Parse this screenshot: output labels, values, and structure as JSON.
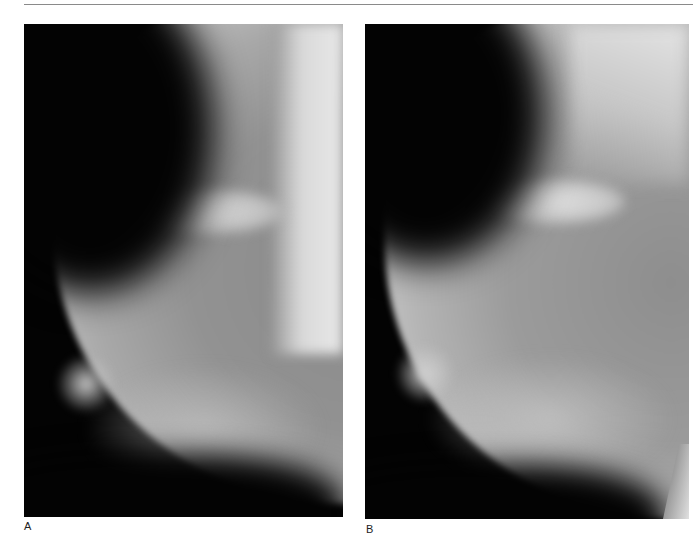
{
  "header": {
    "running_head_fragment": "graphy"
  },
  "figure": {
    "panels": [
      {
        "label": "A",
        "content": "mediolateral oblique mammogram"
      },
      {
        "label": "B",
        "content": "mediolateral oblique mammogram"
      }
    ]
  }
}
